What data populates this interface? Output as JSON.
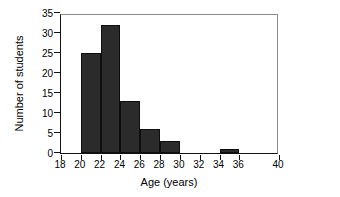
{
  "chart_data": {
    "type": "bar",
    "title": "",
    "subtitle": "",
    "xlabel": "Age (years)",
    "ylabel": "Number of students",
    "xlim": [
      18,
      40
    ],
    "ylim": [
      0,
      35
    ],
    "xticks": [
      18,
      20,
      22,
      24,
      26,
      28,
      30,
      32,
      34,
      36,
      40
    ],
    "yticks": [
      0,
      5,
      10,
      15,
      20,
      25,
      30,
      35
    ],
    "grid": false,
    "legend": null,
    "bar_color": "#2b2b2b",
    "bar_edge_color": "#0e0e0e",
    "axis_color": "#111111",
    "background": "#ffffff",
    "bin_width": 2,
    "bins": [
      {
        "start": 20,
        "end": 22,
        "value": 25
      },
      {
        "start": 22,
        "end": 24,
        "value": 32
      },
      {
        "start": 24,
        "end": 26,
        "value": 13
      },
      {
        "start": 26,
        "end": 28,
        "value": 6
      },
      {
        "start": 28,
        "end": 30,
        "value": 3
      },
      {
        "start": 34,
        "end": 36,
        "value": 1
      }
    ],
    "categories": [
      "20-22",
      "22-24",
      "24-26",
      "26-28",
      "28-30",
      "34-36"
    ],
    "values": [
      25,
      32,
      13,
      6,
      3,
      1
    ]
  }
}
